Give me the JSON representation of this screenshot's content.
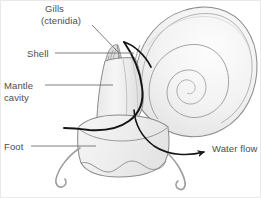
{
  "figure": {
    "type": "anatomical-line-diagram",
    "width": 261,
    "height": 198,
    "background_color": "#ffffff",
    "border_color": "#e9e9e9"
  },
  "labels": {
    "gills": "Gills",
    "ctenidia": "(ctenidia)",
    "shell": "Shell",
    "mantle": "Mantle",
    "cavity": "cavity",
    "foot": "Foot",
    "water_flow": "Water flow"
  },
  "label_order": [
    "Gills",
    "(ctenidia)",
    "Shell",
    "Mantle",
    "cavity",
    "Foot",
    "Water flow"
  ],
  "icons": {
    "water_flow_arrow": "arrow-right-icon",
    "gills_leader": "leader-line-icon",
    "shell_leader": "leader-line-icon",
    "mantle_leader": "leader-line-icon",
    "foot_leader": "leader-line-icon"
  },
  "colors": {
    "label_text": "#4d4d4d",
    "leader_line": "#6f6f6f",
    "outline_light": "#9a9a9a",
    "outline_mid": "#808080",
    "emphasis_dark": "#1a1a1a",
    "shell_fill_light": "#f4f4f4",
    "shell_fill_mid": "#eaeaea",
    "body_fill": "#efefef",
    "gill_fill": "#d9d9d9"
  },
  "annotations": {
    "parts_labeled": 5,
    "arrows": 1,
    "arrow_direction": "right",
    "water_flow_description": "water exits the mantle cavity toward the right"
  }
}
